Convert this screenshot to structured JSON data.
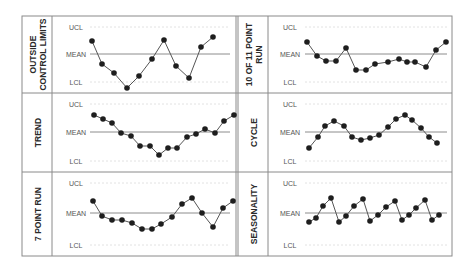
{
  "figure": {
    "title": "Control chart patterns",
    "colors": {
      "border": "#8a8a8a",
      "mean_line": "#8c8c8c",
      "limit_line": "#e2e2e2",
      "series": "#555555",
      "point": "#1e1e1e",
      "label_text": "#2a2a2a",
      "axis_text": "#555555"
    },
    "axis_labels": {
      "ucl": "UCL",
      "mean": "MEAN",
      "lcl": "LCL"
    }
  },
  "chart_data": [
    {
      "type": "line",
      "title": "OUTSIDE CONTROL LIMITS",
      "title_lines": [
        "OUTSIDE",
        "CONTROL LIMITS"
      ],
      "ylabels": [
        "UCL",
        "MEAN",
        "LCL"
      ],
      "points": [
        [
          92,
          41
        ],
        [
          102,
          64
        ],
        [
          114,
          73
        ],
        [
          127,
          88
        ],
        [
          139,
          76
        ],
        [
          152,
          59
        ],
        [
          164,
          40
        ],
        [
          176,
          66
        ],
        [
          189,
          78
        ],
        [
          201,
          47
        ],
        [
          213,
          37
        ]
      ],
      "values": [
        0.48,
        -0.36,
        -0.69,
        -1.24,
        -0.8,
        -0.18,
        0.51,
        -0.44,
        -0.87,
        0.25,
        0.62
      ],
      "ucl": 1,
      "mean": 0,
      "lcl": -1
    },
    {
      "type": "line",
      "title": "10 OF 11 POINT RUN",
      "title_lines": [
        "10 OF 11 POINT",
        "RUN"
      ],
      "ylabels": [
        "UCL",
        "MEAN",
        "LCL"
      ],
      "points": [
        [
          307,
          42
        ],
        [
          317,
          56
        ],
        [
          326,
          61
        ],
        [
          336,
          61
        ],
        [
          346,
          48
        ],
        [
          356,
          70
        ],
        [
          366,
          70
        ],
        [
          375,
          64
        ],
        [
          388,
          62
        ],
        [
          399,
          59
        ],
        [
          407,
          62
        ],
        [
          415,
          62
        ],
        [
          426,
          67
        ],
        [
          436,
          50
        ],
        [
          446,
          42
        ]
      ],
      "values": [
        0.44,
        -0.07,
        -0.25,
        -0.25,
        0.22,
        -0.58,
        -0.58,
        -0.36,
        -0.29,
        -0.18,
        -0.29,
        -0.29,
        -0.47,
        0.15,
        0.44
      ],
      "ucl": 1,
      "mean": 0,
      "lcl": -1
    },
    {
      "type": "line",
      "title": "TREND",
      "title_lines": [
        "TREND"
      ],
      "ylabels": [
        "UCL",
        "MEAN",
        "LCL"
      ],
      "points": [
        [
          94,
          115
        ],
        [
          103,
          119
        ],
        [
          112,
          123
        ],
        [
          121,
          133
        ],
        [
          131,
          136
        ],
        [
          140,
          146
        ],
        [
          150,
          146
        ],
        [
          159,
          155
        ],
        [
          168,
          148
        ],
        [
          177,
          148
        ],
        [
          187,
          137
        ],
        [
          196,
          134
        ],
        [
          205,
          129
        ],
        [
          215,
          133
        ],
        [
          224,
          121
        ],
        [
          234,
          115
        ]
      ],
      "values": [
        0.61,
        0.47,
        0.32,
        -0.04,
        -0.14,
        -0.5,
        -0.5,
        -0.82,
        -0.57,
        -0.57,
        -0.18,
        -0.07,
        0.11,
        -0.04,
        0.39,
        0.61
      ],
      "ucl": 1,
      "mean": 0,
      "lcl": -1
    },
    {
      "type": "line",
      "title": "CYCLE",
      "title_lines": [
        "CYCLE"
      ],
      "ylabels": [
        "UCL",
        "MEAN",
        "LCL"
      ],
      "points": [
        [
          309,
          148
        ],
        [
          318,
          137
        ],
        [
          325,
          126
        ],
        [
          334,
          121
        ],
        [
          344,
          126
        ],
        [
          352,
          137
        ],
        [
          361,
          140
        ],
        [
          370,
          138
        ],
        [
          379,
          135
        ],
        [
          388,
          127
        ],
        [
          396,
          119
        ],
        [
          405,
          115
        ],
        [
          412,
          120
        ],
        [
          421,
          128
        ],
        [
          429,
          137
        ],
        [
          437,
          143
        ]
      ],
      "values": [
        -0.57,
        -0.18,
        0.21,
        0.39,
        0.21,
        -0.18,
        -0.29,
        -0.21,
        -0.11,
        0.18,
        0.46,
        0.61,
        0.43,
        0.14,
        -0.18,
        -0.39
      ],
      "ucl": 1,
      "mean": 0,
      "lcl": -1
    },
    {
      "type": "line",
      "title": "7 POINT RUN",
      "title_lines": [
        "7 POINT RUN"
      ],
      "ylabels": [
        "UCL",
        "MEAN",
        "LCL"
      ],
      "points": [
        [
          93,
          201
        ],
        [
          102,
          216
        ],
        [
          112,
          220
        ],
        [
          122,
          220
        ],
        [
          132,
          223
        ],
        [
          142,
          229
        ],
        [
          152,
          229
        ],
        [
          161,
          224
        ],
        [
          172,
          217
        ],
        [
          182,
          204
        ],
        [
          192,
          198
        ],
        [
          202,
          213
        ],
        [
          213,
          227
        ],
        [
          223,
          208
        ],
        [
          233,
          201
        ]
      ],
      "values": [
        0.36,
        -0.18,
        -0.32,
        -0.32,
        -0.43,
        -0.64,
        -0.64,
        -0.46,
        -0.21,
        0.25,
        0.46,
        -0.07,
        -0.57,
        0.11,
        0.36
      ],
      "ucl": 1,
      "mean": 0,
      "lcl": -1
    },
    {
      "type": "line",
      "title": "SEASONALITY",
      "title_lines": [
        "SEASONALITY"
      ],
      "ylabels": [
        "UCL",
        "MEAN",
        "LCL"
      ],
      "points": [
        [
          309,
          222
        ],
        [
          316,
          218
        ],
        [
          323,
          206
        ],
        [
          331,
          198
        ],
        [
          339,
          222
        ],
        [
          346,
          216
        ],
        [
          354,
          206
        ],
        [
          363,
          199
        ],
        [
          370,
          221
        ],
        [
          378,
          215
        ],
        [
          386,
          207
        ],
        [
          395,
          201
        ],
        [
          402,
          220
        ],
        [
          409,
          215
        ],
        [
          416,
          208
        ],
        [
          425,
          200
        ],
        [
          432,
          220
        ],
        [
          439,
          215
        ]
      ],
      "values": [
        -0.39,
        -0.25,
        0.18,
        0.46,
        -0.39,
        -0.18,
        0.18,
        0.43,
        -0.36,
        -0.14,
        0.14,
        0.36,
        -0.32,
        -0.14,
        0.11,
        0.39,
        -0.32,
        -0.14
      ],
      "ucl": 1,
      "mean": 0,
      "lcl": -1
    }
  ]
}
